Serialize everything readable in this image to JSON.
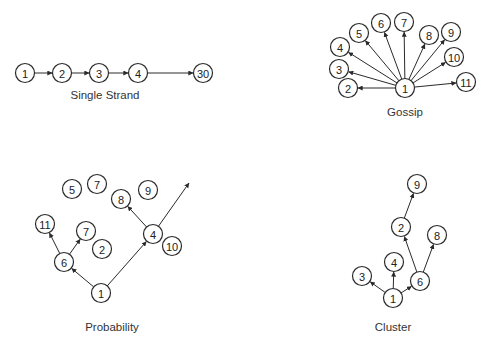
{
  "diagrams": [
    {
      "id": "single-strand",
      "title": "Single Strand",
      "label_pos": [
        105,
        99
      ],
      "nodes": [
        {
          "id": "1",
          "text": "1",
          "x": 25,
          "y": 73
        },
        {
          "id": "2",
          "text": "2",
          "x": 62,
          "y": 73
        },
        {
          "id": "3",
          "text": "3",
          "x": 99,
          "y": 73
        },
        {
          "id": "4",
          "text": "4",
          "x": 138,
          "y": 73
        },
        {
          "id": "30",
          "text": "30",
          "x": 203,
          "y": 73
        }
      ],
      "edges": [
        [
          "1",
          "2"
        ],
        [
          "2",
          "3"
        ],
        [
          "3",
          "4"
        ],
        [
          "4",
          "30"
        ]
      ]
    },
    {
      "id": "gossip",
      "title": "Gossip",
      "label_pos": [
        405,
        116
      ],
      "nodes": [
        {
          "id": "1",
          "text": "1",
          "x": 405,
          "y": 88
        },
        {
          "id": "2",
          "text": "2",
          "x": 348,
          "y": 88
        },
        {
          "id": "3",
          "text": "3",
          "x": 339,
          "y": 69
        },
        {
          "id": "4",
          "text": "4",
          "x": 340,
          "y": 47
        },
        {
          "id": "5",
          "text": "5",
          "x": 359,
          "y": 33
        },
        {
          "id": "6",
          "text": "6",
          "x": 381,
          "y": 23
        },
        {
          "id": "7",
          "text": "7",
          "x": 404,
          "y": 22
        },
        {
          "id": "8",
          "text": "8",
          "x": 429,
          "y": 35
        },
        {
          "id": "9",
          "text": "9",
          "x": 451,
          "y": 32
        },
        {
          "id": "10",
          "text": "10",
          "x": 454,
          "y": 57
        },
        {
          "id": "11",
          "text": "11",
          "x": 466,
          "y": 82
        }
      ],
      "edges": [
        [
          "1",
          "2"
        ],
        [
          "1",
          "3"
        ],
        [
          "1",
          "4"
        ],
        [
          "1",
          "5"
        ],
        [
          "1",
          "6"
        ],
        [
          "1",
          "7"
        ],
        [
          "1",
          "8"
        ],
        [
          "1",
          "9"
        ],
        [
          "1",
          "10"
        ],
        [
          "1",
          "11"
        ]
      ]
    },
    {
      "id": "probability",
      "title": "Probability",
      "label_pos": [
        112,
        331
      ],
      "nodes": [
        {
          "id": "5",
          "text": "5",
          "x": 72,
          "y": 189
        },
        {
          "id": "7a",
          "text": "7",
          "x": 97,
          "y": 184
        },
        {
          "id": "8",
          "text": "8",
          "x": 121,
          "y": 199
        },
        {
          "id": "9",
          "text": "9",
          "x": 148,
          "y": 190
        },
        {
          "id": "11",
          "text": "11",
          "x": 45,
          "y": 224
        },
        {
          "id": "7b",
          "text": "7",
          "x": 86,
          "y": 231
        },
        {
          "id": "2",
          "text": "2",
          "x": 102,
          "y": 249
        },
        {
          "id": "6",
          "text": "6",
          "x": 64,
          "y": 262
        },
        {
          "id": "4",
          "text": "4",
          "x": 153,
          "y": 234
        },
        {
          "id": "10",
          "text": "10",
          "x": 172,
          "y": 246
        },
        {
          "id": "1",
          "text": "1",
          "x": 101,
          "y": 293
        }
      ],
      "edges": [
        [
          "1",
          "6"
        ],
        [
          "1",
          "4"
        ],
        [
          "6",
          "11"
        ],
        [
          "6",
          "7b"
        ],
        [
          "4",
          "8"
        ]
      ],
      "open_edges": [
        {
          "from": "4",
          "to": [
            189,
            183
          ]
        }
      ]
    },
    {
      "id": "cluster",
      "title": "Cluster",
      "label_pos": [
        393,
        331
      ],
      "nodes": [
        {
          "id": "9",
          "text": "9",
          "x": 417,
          "y": 184
        },
        {
          "id": "2",
          "text": "2",
          "x": 401,
          "y": 227
        },
        {
          "id": "8",
          "text": "8",
          "x": 437,
          "y": 235
        },
        {
          "id": "4",
          "text": "4",
          "x": 394,
          "y": 262
        },
        {
          "id": "3",
          "text": "3",
          "x": 362,
          "y": 276
        },
        {
          "id": "6",
          "text": "6",
          "x": 420,
          "y": 281
        },
        {
          "id": "1",
          "text": "1",
          "x": 393,
          "y": 298
        }
      ],
      "edges": [
        [
          "1",
          "3"
        ],
        [
          "1",
          "4"
        ],
        [
          "1",
          "6"
        ],
        [
          "6",
          "2"
        ],
        [
          "6",
          "8"
        ],
        [
          "2",
          "9"
        ]
      ]
    }
  ],
  "style": {
    "node_radius": 9.5,
    "stroke_color": "#2a2a2a",
    "background": "#ffffff"
  }
}
